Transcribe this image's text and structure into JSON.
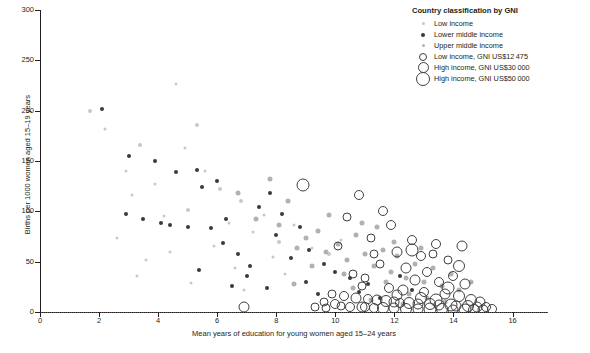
{
  "chart_data": {
    "type": "scatter",
    "title": "",
    "xlabel": "Mean years of education for young women aged 15–24 years",
    "ylabel": "Births per 1000 women aged 15–19 years",
    "xlim": [
      0,
      17.2
    ],
    "ylim": [
      0,
      300
    ],
    "xticks": [
      0,
      2,
      4,
      6,
      8,
      10,
      12,
      14,
      16
    ],
    "yticks": [
      0,
      50,
      100,
      150,
      200,
      250,
      300
    ],
    "grid": false,
    "reference_line": {
      "axis": "y",
      "value": 0,
      "style": "dotted"
    },
    "legend": {
      "position": "top-right",
      "title": "Country classification by GNI",
      "entries": [
        {
          "label": "Low income",
          "marker": "filled-circle",
          "color": "#c7c8ca",
          "size": 3
        },
        {
          "label": "Lower middle income",
          "marker": "filled-circle",
          "color": "#3a3a3c",
          "size": 4
        },
        {
          "label": "Upper middle income",
          "marker": "filled-circle",
          "color": "#b0b1b3",
          "size": 3
        },
        {
          "label": "Low income, GNI US$12 475",
          "marker": "open-circle",
          "color": "#414042",
          "size": 6
        },
        {
          "label": "High income, GNI US$30 000",
          "marker": "open-circle",
          "color": "#414042",
          "size": 9
        },
        {
          "label": "High income, GNI US$50 000",
          "marker": "open-circle",
          "color": "#414042",
          "size": 12
        }
      ]
    },
    "series": [
      {
        "name": "Low income",
        "marker": "filled-circle",
        "color": "#c7c8ca",
        "points": [
          [
            1.7,
            200,
            4
          ],
          [
            2.2,
            182,
            3
          ],
          [
            3.4,
            166,
            4
          ],
          [
            2.9,
            140,
            3
          ],
          [
            4.6,
            226,
            3
          ],
          [
            4.9,
            163,
            3
          ],
          [
            5.3,
            186,
            4
          ],
          [
            3.1,
            116,
            3
          ],
          [
            3.9,
            127,
            3
          ],
          [
            4.2,
            95,
            3
          ],
          [
            5.0,
            101,
            4
          ],
          [
            5.6,
            140,
            3
          ],
          [
            6.1,
            122,
            4
          ],
          [
            6.4,
            88,
            3
          ],
          [
            5.9,
            66,
            3
          ],
          [
            4.4,
            60,
            3
          ],
          [
            3.6,
            52,
            3
          ],
          [
            6.8,
            110,
            4
          ],
          [
            7.2,
            79,
            3
          ],
          [
            7.6,
            96,
            3
          ],
          [
            8.1,
            70,
            4
          ],
          [
            6.6,
            44,
            3
          ],
          [
            7.9,
            55,
            3
          ],
          [
            8.6,
            86,
            3
          ],
          [
            9.2,
            64,
            3
          ],
          [
            8.3,
            38,
            3
          ],
          [
            9.8,
            58,
            4
          ],
          [
            10.2,
            72,
            3
          ],
          [
            2.6,
            74,
            3
          ],
          [
            3.3,
            36,
            3
          ],
          [
            5.1,
            29,
            3
          ],
          [
            6.9,
            22,
            3
          ]
        ]
      },
      {
        "name": "Lower middle income",
        "marker": "filled-circle",
        "color": "#3a3a3c",
        "points": [
          [
            2.1,
            202,
            4
          ],
          [
            3.0,
            155,
            4
          ],
          [
            3.9,
            150,
            4
          ],
          [
            4.6,
            139,
            4
          ],
          [
            5.3,
            141,
            4
          ],
          [
            5.5,
            124,
            4
          ],
          [
            6.0,
            130,
            4
          ],
          [
            6.3,
            92,
            4
          ],
          [
            4.1,
            88,
            4
          ],
          [
            4.4,
            86,
            4
          ],
          [
            5.0,
            84,
            4
          ],
          [
            5.8,
            83,
            4
          ],
          [
            6.2,
            69,
            4
          ],
          [
            6.7,
            58,
            4
          ],
          [
            7.1,
            46,
            4
          ],
          [
            5.4,
            42,
            4
          ],
          [
            7.4,
            104,
            4
          ],
          [
            7.8,
            118,
            4
          ],
          [
            8.2,
            97,
            4
          ],
          [
            8.0,
            76,
            4
          ],
          [
            8.8,
            84,
            4
          ],
          [
            9.1,
            62,
            4
          ],
          [
            7.0,
            36,
            4
          ],
          [
            8.5,
            54,
            4
          ],
          [
            9.6,
            48,
            4
          ],
          [
            10.0,
            40,
            4
          ],
          [
            6.5,
            26,
            4
          ],
          [
            7.7,
            24,
            4
          ],
          [
            9.0,
            30,
            4
          ],
          [
            10.5,
            34,
            4
          ],
          [
            11.1,
            28,
            4
          ],
          [
            9.4,
            18,
            4
          ],
          [
            10.8,
            20,
            4
          ],
          [
            12.2,
            36,
            4
          ],
          [
            12.6,
            22,
            4
          ],
          [
            11.5,
            14,
            4
          ],
          [
            2.9,
            97,
            4
          ],
          [
            3.5,
            92,
            4
          ]
        ]
      },
      {
        "name": "Upper middle income",
        "marker": "filled-circle",
        "color": "#b0b1b3",
        "points": [
          [
            7.3,
            92,
            5
          ],
          [
            8.1,
            86,
            5
          ],
          [
            8.7,
            64,
            5
          ],
          [
            9.0,
            74,
            5
          ],
          [
            9.4,
            80,
            5
          ],
          [
            9.7,
            60,
            5
          ],
          [
            10.1,
            68,
            5
          ],
          [
            10.4,
            52,
            5
          ],
          [
            10.7,
            76,
            5
          ],
          [
            11.0,
            58,
            5
          ],
          [
            11.3,
            46,
            5
          ],
          [
            11.6,
            62,
            5
          ],
          [
            11.9,
            40,
            5
          ],
          [
            12.1,
            56,
            5
          ],
          [
            12.4,
            34,
            5
          ],
          [
            12.7,
            48,
            5
          ],
          [
            13.0,
            30,
            5
          ],
          [
            13.3,
            44,
            5
          ],
          [
            13.6,
            26,
            5
          ],
          [
            12.0,
            70,
            5
          ],
          [
            10.9,
            88,
            5
          ],
          [
            9.8,
            96,
            5
          ],
          [
            8.4,
            110,
            5
          ],
          [
            11.4,
            84,
            5
          ],
          [
            12.9,
            64,
            5
          ],
          [
            13.9,
            38,
            5
          ],
          [
            14.2,
            22,
            5
          ],
          [
            10.3,
            38,
            5
          ],
          [
            11.7,
            30,
            5
          ],
          [
            12.5,
            18,
            5
          ],
          [
            13.1,
            14,
            5
          ],
          [
            9.2,
            46,
            5
          ],
          [
            8.6,
            28,
            5
          ],
          [
            14.6,
            30,
            5
          ],
          [
            13.7,
            10,
            5
          ],
          [
            7.8,
            132,
            5
          ],
          [
            6.7,
            118,
            5
          ],
          [
            10.6,
            24,
            5
          ],
          [
            12.3,
            8,
            5
          ],
          [
            11.2,
            12,
            5
          ]
        ]
      },
      {
        "name": "High income",
        "marker": "open-circle",
        "color": "#414042",
        "points": [
          [
            6.9,
            5,
            9
          ],
          [
            8.9,
            126,
            11
          ],
          [
            10.8,
            116,
            8
          ],
          [
            11.6,
            100,
            8
          ],
          [
            10.4,
            94,
            7
          ],
          [
            11.9,
            86,
            8
          ],
          [
            11.2,
            74,
            7
          ],
          [
            12.6,
            72,
            8
          ],
          [
            13.4,
            68,
            8
          ],
          [
            10.1,
            66,
            7
          ],
          [
            12.1,
            60,
            9
          ],
          [
            12.9,
            56,
            8
          ],
          [
            13.8,
            52,
            7
          ],
          [
            11.5,
            48,
            7
          ],
          [
            12.4,
            44,
            9
          ],
          [
            13.1,
            40,
            8
          ],
          [
            10.6,
            38,
            7
          ],
          [
            14.0,
            36,
            8
          ],
          [
            11.0,
            34,
            7
          ],
          [
            12.7,
            32,
            9
          ],
          [
            13.5,
            30,
            8
          ],
          [
            14.4,
            28,
            9
          ],
          [
            10.9,
            26,
            7
          ],
          [
            11.8,
            24,
            8
          ],
          [
            12.3,
            22,
            9
          ],
          [
            13.0,
            20,
            8
          ],
          [
            13.7,
            18,
            9
          ],
          [
            14.2,
            16,
            10
          ],
          [
            9.9,
            18,
            7
          ],
          [
            10.3,
            16,
            8
          ],
          [
            10.7,
            14,
            9
          ],
          [
            11.1,
            13,
            8
          ],
          [
            11.4,
            12,
            9
          ],
          [
            11.7,
            11,
            10
          ],
          [
            12.0,
            10,
            9
          ],
          [
            12.2,
            9,
            8
          ],
          [
            12.5,
            9,
            10
          ],
          [
            12.8,
            8,
            9
          ],
          [
            13.2,
            8,
            10
          ],
          [
            13.5,
            7,
            9
          ],
          [
            13.9,
            7,
            11
          ],
          [
            14.1,
            6,
            9
          ],
          [
            14.5,
            6,
            10
          ],
          [
            14.8,
            5,
            9
          ],
          [
            15.1,
            5,
            8
          ],
          [
            9.6,
            10,
            7
          ],
          [
            10.0,
            8,
            8
          ],
          [
            10.2,
            6,
            7
          ],
          [
            10.5,
            5,
            8
          ],
          [
            10.9,
            5,
            9
          ],
          [
            11.3,
            4,
            8
          ],
          [
            11.6,
            4,
            10
          ],
          [
            12.0,
            4,
            9
          ],
          [
            12.4,
            3,
            10
          ],
          [
            12.8,
            3,
            9
          ],
          [
            13.2,
            3,
            11
          ],
          [
            13.6,
            3,
            10
          ],
          [
            14.0,
            2,
            9
          ],
          [
            14.4,
            2,
            11
          ],
          [
            14.7,
            2,
            10
          ],
          [
            15.0,
            2,
            9
          ],
          [
            15.3,
            3,
            8
          ],
          [
            9.3,
            5,
            7
          ],
          [
            9.7,
            4,
            7
          ],
          [
            12.6,
            62,
            11
          ],
          [
            14.3,
            66,
            9
          ],
          [
            13.3,
            58,
            7
          ],
          [
            11.3,
            58,
            7
          ],
          [
            12.9,
            14,
            10
          ],
          [
            13.4,
            12,
            11
          ],
          [
            14.6,
            12,
            10
          ],
          [
            14.9,
            10,
            9
          ],
          [
            12.1,
            17,
            9
          ],
          [
            11.0,
            5,
            8
          ],
          [
            14.2,
            46,
            10
          ],
          [
            13.8,
            24,
            11
          ]
        ]
      }
    ]
  },
  "axes": {
    "y_title": "Births per 1000 women aged 15–19 years",
    "x_title": "Mean years of education for young women aged 15–24 years",
    "y_tick_labels": [
      "0",
      "50",
      "100",
      "150",
      "200",
      "250",
      "300"
    ],
    "x_tick_labels": [
      "0",
      "2",
      "4",
      "6",
      "8",
      "10",
      "12",
      "14",
      "16"
    ]
  },
  "legend": {
    "title": "Country classification by GNI",
    "items": [
      "Low income",
      "Lower middle income",
      "Upper middle income",
      "Low income, GNI US$12 475",
      "High income, GNI US$30 000",
      "High income, GNI US$50 000"
    ]
  },
  "colors": {
    "low_income": "#c7c8ca",
    "lower_middle_income": "#3a3a3c",
    "upper_middle_income": "#b0b1b3",
    "high_income_ring": "#414042",
    "axis": "#231f20",
    "background": "#ffffff"
  }
}
